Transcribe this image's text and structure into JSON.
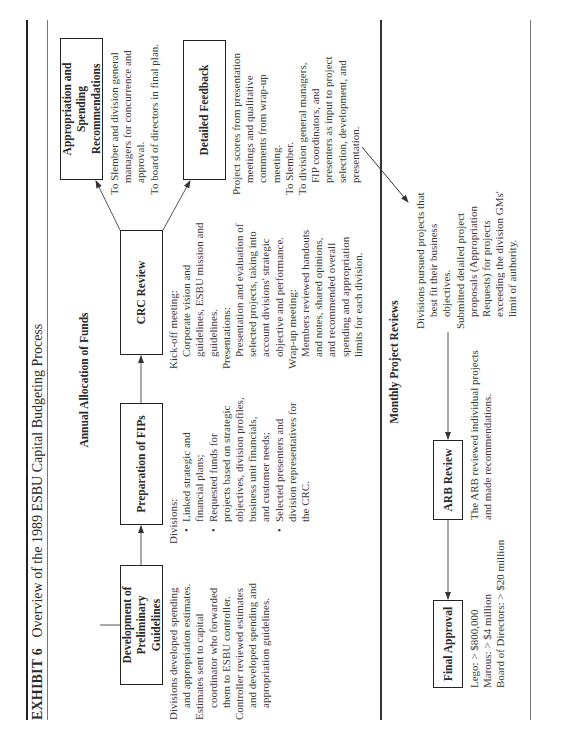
{
  "header": {
    "exhibit_label": "EXHIBIT 6",
    "title": "Overview of the 1989 ESBU Capital Budgeting Process"
  },
  "annual": {
    "heading": "Annual Allocation of Funds",
    "steps": [
      {
        "label": "Development of Preliminary Guidelines",
        "label_lines": [
          "Development of",
          "Preliminary Guidelines"
        ],
        "lines": [
          {
            "t": "Divisions developed spending",
            "k": "ln"
          },
          {
            "t": "and appropriation estimates.",
            "k": "sub"
          },
          {
            "t": "Estimates sent to capital",
            "k": "ln"
          },
          {
            "t": "coordinator who forwarded",
            "k": "sub"
          },
          {
            "t": "them to ESBU controller.",
            "k": "sub"
          },
          {
            "t": "Controller reviewed estimates",
            "k": "ln"
          },
          {
            "t": "and developed spending and",
            "k": "sub"
          },
          {
            "t": "appropriation guidelines.",
            "k": "sub"
          }
        ]
      },
      {
        "label": "Preparation of FIPs",
        "lines": [
          {
            "t": "Divisions:",
            "k": "ln"
          },
          {
            "t": "Linked strategic and",
            "k": "bul"
          },
          {
            "t": "financial plans;",
            "k": "bulc"
          },
          {
            "t": "Requested funds for",
            "k": "bul"
          },
          {
            "t": "projects based on strategic",
            "k": "bulc"
          },
          {
            "t": "objectives, division profiles,",
            "k": "bulc"
          },
          {
            "t": "business unit financials,",
            "k": "bulc"
          },
          {
            "t": "and customer needs;",
            "k": "bulc"
          },
          {
            "t": "Selected presenters and",
            "k": "bul"
          },
          {
            "t": "division representatives for",
            "k": "bulc"
          },
          {
            "t": "the CRC.",
            "k": "bulc"
          }
        ]
      },
      {
        "label": "CRC Review",
        "lines": [
          {
            "t": "Kick-off meeting:",
            "k": "ln"
          },
          {
            "t": "Corporate vision and",
            "k": "sub"
          },
          {
            "t": "guidelines, ESBU mission and",
            "k": "sub"
          },
          {
            "t": "guidelines.",
            "k": "sub"
          },
          {
            "t": "Presentations:",
            "k": "ln"
          },
          {
            "t": "Presentation and evaluation of",
            "k": "sub"
          },
          {
            "t": "selected projects, taking into",
            "k": "sub"
          },
          {
            "t": "account divisions' strategic",
            "k": "sub"
          },
          {
            "t": "objective and performance.",
            "k": "sub"
          },
          {
            "t": "Wrap-up meeting:",
            "k": "ln"
          },
          {
            "t": "Members reviewed handouts",
            "k": "sub"
          },
          {
            "t": "and notes, shared opinions,",
            "k": "sub"
          },
          {
            "t": "and recommended overall",
            "k": "sub"
          },
          {
            "t": "spending and appropriation",
            "k": "sub"
          },
          {
            "t": "limits for each division.",
            "k": "sub"
          }
        ]
      }
    ],
    "outputs": [
      {
        "label": "Appropriation and Spending Recommendations",
        "label_lines": [
          "Appropriation and Spending",
          "Recommendations"
        ],
        "lines": [
          {
            "t": "To Slember and division general",
            "k": "ln"
          },
          {
            "t": "managers for concurrence and",
            "k": "sub"
          },
          {
            "t": "approval.",
            "k": "sub"
          },
          {
            "t": "To board of directors in final plan.",
            "k": "ln"
          }
        ]
      },
      {
        "label": "Detailed Feedback",
        "lines": [
          {
            "t": "Project scores from presentation",
            "k": "ln"
          },
          {
            "t": "meetings and qualitative",
            "k": "sub"
          },
          {
            "t": "comments from wrap-up",
            "k": "sub"
          },
          {
            "t": "meeting.",
            "k": "sub"
          },
          {
            "t": "To Slember.",
            "k": "ln"
          },
          {
            "t": "To division general managers,",
            "k": "ln"
          },
          {
            "t": "FIP coordinators, and",
            "k": "sub"
          },
          {
            "t": "presenters as input to project",
            "k": "sub"
          },
          {
            "t": "selection, development, and",
            "k": "sub"
          },
          {
            "t": "presentation.",
            "k": "sub"
          }
        ]
      }
    ]
  },
  "monthly": {
    "heading": "Monthly Project Reviews",
    "final_approval": {
      "label": "Final Approval",
      "lines": [
        {
          "t": "Lego: > $800,000",
          "k": "ln"
        },
        {
          "t": "Marous: > $4 million",
          "k": "ln"
        },
        {
          "t": "Board of Directors: > $20 million",
          "k": "ln"
        }
      ]
    },
    "arb_review": {
      "label": "ARB Review",
      "lines": [
        {
          "t": "The ARB reviewed individual projects",
          "k": "ln"
        },
        {
          "t": "and made recommendations.",
          "k": "ln"
        }
      ]
    },
    "divisions": {
      "lines": [
        {
          "t": "Divisions pursued projects that",
          "k": "ln"
        },
        {
          "t": "best fit their business",
          "k": "sub"
        },
        {
          "t": "objectives.",
          "k": "sub"
        },
        {
          "t": "Submitted detailed project",
          "k": "ln"
        },
        {
          "t": "proposals (Appropriation",
          "k": "sub"
        },
        {
          "t": "Requests) for projects",
          "k": "sub"
        },
        {
          "t": "exceeding the division GMs'",
          "k": "sub"
        },
        {
          "t": "limit of authority.",
          "k": "sub"
        }
      ]
    }
  }
}
